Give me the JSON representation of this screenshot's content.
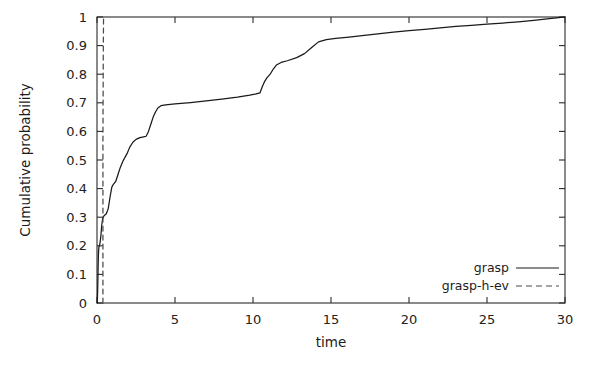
{
  "chart_data": {
    "type": "line",
    "title": "",
    "xlabel": "time",
    "ylabel": "Cumulative probability",
    "xlim": [
      0,
      30
    ],
    "ylim": [
      0,
      1
    ],
    "grid": false,
    "legend_position": "bottom-right-inside",
    "xticks": [
      0,
      5,
      10,
      15,
      20,
      25,
      30
    ],
    "xtick_labels": [
      "0",
      "5",
      "10",
      "15",
      "20",
      "25",
      "30"
    ],
    "yticks": [
      0,
      0.1,
      0.2,
      0.3,
      0.4,
      0.5,
      0.6,
      0.7,
      0.8,
      0.9,
      1
    ],
    "ytick_labels": [
      "0",
      "0.1",
      "0.2",
      "0.3",
      "0.4",
      "0.5",
      "0.6",
      "0.7",
      "0.8",
      "0.9",
      "1"
    ],
    "series": [
      {
        "name": "grasp",
        "style": "solid",
        "color": "#1a1a1a",
        "points": [
          [
            0.02,
            0.0
          ],
          [
            0.05,
            0.06
          ],
          [
            0.07,
            0.12
          ],
          [
            0.09,
            0.17
          ],
          [
            0.12,
            0.195
          ],
          [
            0.18,
            0.205
          ],
          [
            0.25,
            0.235
          ],
          [
            0.3,
            0.27
          ],
          [
            0.36,
            0.295
          ],
          [
            0.45,
            0.305
          ],
          [
            0.6,
            0.312
          ],
          [
            0.72,
            0.33
          ],
          [
            0.85,
            0.375
          ],
          [
            0.95,
            0.405
          ],
          [
            1.05,
            0.415
          ],
          [
            1.2,
            0.425
          ],
          [
            1.35,
            0.45
          ],
          [
            1.5,
            0.475
          ],
          [
            1.65,
            0.495
          ],
          [
            1.8,
            0.51
          ],
          [
            1.95,
            0.525
          ],
          [
            2.1,
            0.545
          ],
          [
            2.3,
            0.562
          ],
          [
            2.5,
            0.572
          ],
          [
            2.75,
            0.578
          ],
          [
            3.0,
            0.581
          ],
          [
            3.15,
            0.583
          ],
          [
            3.3,
            0.6
          ],
          [
            3.45,
            0.625
          ],
          [
            3.6,
            0.65
          ],
          [
            3.75,
            0.668
          ],
          [
            3.9,
            0.682
          ],
          [
            4.1,
            0.69
          ],
          [
            4.4,
            0.693
          ],
          [
            5.0,
            0.696
          ],
          [
            6.0,
            0.701
          ],
          [
            7.0,
            0.707
          ],
          [
            8.0,
            0.713
          ],
          [
            9.0,
            0.72
          ],
          [
            9.8,
            0.727
          ],
          [
            10.2,
            0.731
          ],
          [
            10.45,
            0.735
          ],
          [
            10.6,
            0.757
          ],
          [
            10.75,
            0.775
          ],
          [
            10.9,
            0.788
          ],
          [
            11.1,
            0.8
          ],
          [
            11.3,
            0.818
          ],
          [
            11.5,
            0.832
          ],
          [
            11.8,
            0.841
          ],
          [
            12.2,
            0.847
          ],
          [
            12.8,
            0.858
          ],
          [
            13.3,
            0.872
          ],
          [
            13.8,
            0.895
          ],
          [
            14.2,
            0.913
          ],
          [
            14.7,
            0.921
          ],
          [
            15.3,
            0.925
          ],
          [
            16.0,
            0.929
          ],
          [
            17.0,
            0.935
          ],
          [
            18.0,
            0.941
          ],
          [
            19.0,
            0.947
          ],
          [
            20.0,
            0.952
          ],
          [
            21.0,
            0.957
          ],
          [
            22.0,
            0.962
          ],
          [
            23.0,
            0.967
          ],
          [
            24.0,
            0.971
          ],
          [
            25.0,
            0.975
          ],
          [
            26.0,
            0.979
          ],
          [
            27.0,
            0.983
          ],
          [
            28.0,
            0.988
          ],
          [
            29.0,
            0.994
          ],
          [
            29.6,
            0.998
          ],
          [
            30.0,
            1.0
          ]
        ]
      },
      {
        "name": "grasp-h-ev",
        "style": "dashed",
        "color": "#4a4a4a",
        "points": [
          [
            0.38,
            0.0
          ],
          [
            0.38,
            0.55
          ],
          [
            0.4,
            0.85
          ],
          [
            0.42,
            1.0
          ]
        ]
      }
    ]
  },
  "legend": {
    "items": [
      {
        "label": "grasp",
        "style": "solid"
      },
      {
        "label": "grasp-h-ev",
        "style": "dashed"
      }
    ]
  },
  "axes": {
    "x_title": "time",
    "y_title": "Cumulative probability"
  }
}
